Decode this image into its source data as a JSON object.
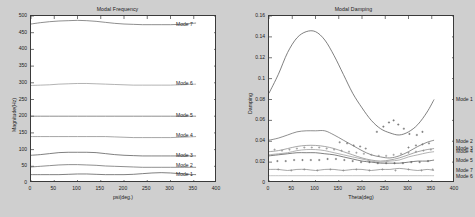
{
  "figure": {
    "background_color": "#cfcfcf",
    "axes_background": "#ffffff"
  },
  "chart_data": [
    {
      "type": "line",
      "id": "modal-frequency",
      "title": "Modal Frequency",
      "xlabel": "psi(deg.)",
      "ylabel": "Magnitude(Hz)",
      "xlim": [
        0,
        400
      ],
      "ylim": [
        0,
        500
      ],
      "xticks": [
        "0",
        "50",
        "100",
        "150",
        "200",
        "250",
        "300",
        "350",
        "400"
      ],
      "yticks": [
        "0",
        "50",
        "100",
        "150",
        "200",
        "250",
        "300",
        "350",
        "400",
        "450",
        "500"
      ],
      "grid": false,
      "legend_position": "inline-right",
      "x": [
        0,
        20,
        40,
        60,
        80,
        100,
        120,
        140,
        160,
        180,
        200,
        220,
        240,
        260,
        280,
        300,
        320,
        340,
        355
      ],
      "series": [
        {
          "name": "Mode 1",
          "color": "#555555",
          "label_y": 25,
          "values": [
            25,
            25,
            25,
            25,
            26,
            27,
            27,
            26,
            25,
            25,
            25,
            26,
            28,
            30,
            31,
            30,
            28,
            26,
            25
          ]
        },
        {
          "name": "Mode 2",
          "color": "#6a6a6a",
          "label_y": 50,
          "values": [
            48,
            50,
            52,
            54,
            55,
            55,
            54,
            53,
            51,
            50,
            49,
            48,
            47,
            47,
            47,
            47,
            47,
            47,
            47
          ]
        },
        {
          "name": "Mode 3",
          "color": "#555555",
          "label_y": 82,
          "values": [
            83,
            85,
            88,
            91,
            92,
            92,
            92,
            91,
            88,
            85,
            83,
            82,
            81,
            81,
            81,
            81,
            81,
            81,
            81
          ]
        },
        {
          "name": "Mode 4",
          "color": "#8a8a8a",
          "label_y": 140,
          "values": [
            139,
            139,
            139,
            139,
            139,
            139,
            139,
            139,
            139,
            138,
            137,
            136,
            136,
            136,
            136,
            136,
            137,
            138,
            139
          ]
        },
        {
          "name": "Mode 5",
          "color": "#6a6a6a",
          "label_y": 200,
          "values": [
            200,
            200,
            200,
            200,
            200,
            200,
            200,
            200,
            200,
            200,
            200,
            200,
            200,
            200,
            200,
            200,
            200,
            200,
            200
          ]
        },
        {
          "name": "Mode 6",
          "color": "#9a9a9a",
          "label_y": 295,
          "values": [
            292,
            293,
            294,
            296,
            297,
            298,
            298,
            297,
            296,
            295,
            294,
            293,
            293,
            293,
            293,
            293,
            294,
            295,
            296
          ]
        },
        {
          "name": "Mode 7",
          "color": "#6a6a6a",
          "label_y": 472,
          "values": [
            476,
            480,
            483,
            485,
            486,
            487,
            486,
            484,
            481,
            478,
            476,
            475,
            474,
            474,
            474,
            474,
            475,
            477,
            479
          ]
        }
      ]
    },
    {
      "type": "line",
      "id": "modal-damping",
      "title": "Modal Damping",
      "xlabel": "Theta(deg)",
      "ylabel": "Damping",
      "xlim": [
        0,
        400
      ],
      "ylim": [
        0,
        0.16
      ],
      "xticks": [
        "0",
        "50",
        "100",
        "150",
        "200",
        "250",
        "300",
        "350",
        "400"
      ],
      "yticks": [
        "0",
        "0.02",
        "0.04",
        "0.06",
        "0.08",
        "0.1",
        "0.12",
        "0.14",
        "0.16"
      ],
      "grid": false,
      "legend_position": "inline-right",
      "x": [
        0,
        20,
        40,
        60,
        80,
        100,
        120,
        140,
        160,
        180,
        200,
        220,
        240,
        260,
        280,
        300,
        320,
        340,
        355
      ],
      "series": [
        {
          "name": "Mode 1",
          "color": "#555555",
          "label_y": 0.0795,
          "values": [
            0.086,
            0.104,
            0.125,
            0.139,
            0.145,
            0.145,
            0.137,
            0.122,
            0.104,
            0.086,
            0.072,
            0.06,
            0.052,
            0.048,
            0.046,
            0.049,
            0.056,
            0.068,
            0.08
          ]
        },
        {
          "name": "Mode 2",
          "color": "#6a6a6a",
          "label_y": 0.0395,
          "values": [
            0.041,
            0.043,
            0.046,
            0.049,
            0.05,
            0.05,
            0.05,
            0.046,
            0.041,
            0.036,
            0.031,
            0.027,
            0.025,
            0.024,
            0.026,
            0.03,
            0.035,
            0.039,
            0.041
          ]
        },
        {
          "name": "Mode 3",
          "color": "#8a8a8a",
          "label_y": 0.0325,
          "values": [
            0.03,
            0.031,
            0.033,
            0.035,
            0.036,
            0.036,
            0.035,
            0.033,
            0.03,
            0.027,
            0.024,
            0.022,
            0.021,
            0.022,
            0.024,
            0.027,
            0.03,
            0.032,
            0.033
          ]
        },
        {
          "name": "Mode 4",
          "color": "#9a9a9a",
          "label_y": 0.0295,
          "values": [
            0.027,
            0.028,
            0.029,
            0.031,
            0.032,
            0.032,
            0.031,
            0.029,
            0.027,
            0.025,
            0.023,
            0.021,
            0.02,
            0.021,
            0.022,
            0.025,
            0.027,
            0.029,
            0.03
          ]
        },
        {
          "name": "Mode 5",
          "color": "#555555",
          "label_y": 0.0215,
          "values": [
            0.026,
            0.027,
            0.028,
            0.029,
            0.029,
            0.029,
            0.028,
            0.027,
            0.025,
            0.023,
            0.021,
            0.02,
            0.019,
            0.019,
            0.019,
            0.02,
            0.021,
            0.021,
            0.022
          ]
        },
        {
          "name": "Mode 7",
          "color": "#8a8a8a",
          "label_y": 0.0115,
          "values": [
            0.013,
            0.013,
            0.012,
            0.013,
            0.013,
            0.012,
            0.013,
            0.013,
            0.012,
            0.013,
            0.013,
            0.012,
            0.013,
            0.013,
            0.014,
            0.013,
            0.012,
            0.013,
            0.012
          ]
        },
        {
          "name": "Mode 6",
          "color": "#b0b0b0",
          "label_y": 0.0055,
          "values": [
            0.007,
            0.007,
            0.007,
            0.007,
            0.007,
            0.007,
            0.007,
            0.007,
            0.007,
            0.007,
            0.007,
            0.007,
            0.007,
            0.007,
            0.007,
            0.007,
            0.007,
            0.007,
            0.007
          ]
        }
      ],
      "scatter": [
        {
          "name": "Mode 1 data",
          "color": "#555555",
          "points": [
            [
              232,
              0.049
            ],
            [
              246,
              0.054
            ],
            [
              258,
              0.058
            ],
            [
              268,
              0.06
            ],
            [
              278,
              0.056
            ],
            [
              290,
              0.052
            ],
            [
              302,
              0.047
            ],
            [
              318,
              0.046
            ],
            [
              330,
              0.049
            ]
          ]
        },
        {
          "name": "Mode 2 data",
          "color": "#6a6a6a",
          "points": [
            [
              152,
              0.039
            ],
            [
              168,
              0.038
            ],
            [
              182,
              0.036
            ],
            [
              196,
              0.035
            ],
            [
              208,
              0.033
            ],
            [
              300,
              0.034
            ],
            [
              316,
              0.036
            ],
            [
              330,
              0.037
            ],
            [
              344,
              0.038
            ]
          ]
        },
        {
          "name": "Mode 3 data",
          "color": "#8a8a8a",
          "points": [
            [
              12,
              0.032
            ],
            [
              28,
              0.031
            ],
            [
              44,
              0.032
            ],
            [
              60,
              0.033
            ],
            [
              76,
              0.034
            ],
            [
              92,
              0.034
            ],
            [
              108,
              0.034
            ],
            [
              124,
              0.033
            ],
            [
              140,
              0.032
            ],
            [
              156,
              0.031
            ],
            [
              172,
              0.03
            ],
            [
              188,
              0.029
            ],
            [
              204,
              0.028
            ],
            [
              220,
              0.027
            ],
            [
              236,
              0.026
            ],
            [
              252,
              0.026
            ],
            [
              268,
              0.027
            ],
            [
              284,
              0.028
            ],
            [
              300,
              0.029
            ],
            [
              316,
              0.03
            ],
            [
              332,
              0.031
            ],
            [
              348,
              0.032
            ]
          ]
        },
        {
          "name": "Mode 5 data",
          "color": "#555555",
          "points": [
            [
              18,
              0.021
            ],
            [
              36,
              0.021
            ],
            [
              54,
              0.022
            ],
            [
              72,
              0.022
            ],
            [
              90,
              0.022
            ],
            [
              108,
              0.022
            ],
            [
              126,
              0.023
            ],
            [
              144,
              0.023
            ],
            [
              162,
              0.022
            ],
            [
              180,
              0.021
            ],
            [
              198,
              0.02
            ],
            [
              216,
              0.02
            ],
            [
              234,
              0.019
            ],
            [
              252,
              0.019
            ],
            [
              270,
              0.019
            ],
            [
              288,
              0.019
            ],
            [
              306,
              0.02
            ],
            [
              324,
              0.02
            ],
            [
              342,
              0.021
            ]
          ]
        },
        {
          "name": "Mode 7 data",
          "color": "#8a8a8a",
          "points": [
            [
              20,
              0.013
            ],
            [
              48,
              0.012
            ],
            [
              76,
              0.013
            ],
            [
              104,
              0.012
            ],
            [
              132,
              0.013
            ],
            [
              160,
              0.012
            ],
            [
              188,
              0.013
            ],
            [
              216,
              0.012
            ],
            [
              244,
              0.013
            ],
            [
              272,
              0.012
            ],
            [
              300,
              0.013
            ],
            [
              328,
              0.012
            ],
            [
              352,
              0.013
            ]
          ]
        }
      ]
    }
  ]
}
